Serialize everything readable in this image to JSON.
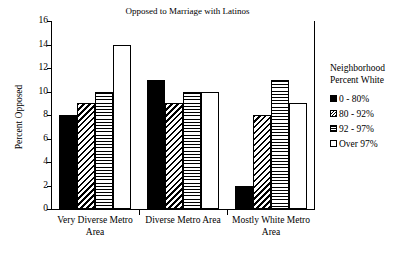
{
  "chart_data": {
    "type": "bar",
    "title": "Opposed to Marriage with Latinos",
    "xlabel": "",
    "ylabel": "Percent Opposed",
    "ylim": [
      0,
      16
    ],
    "yticks": [
      0,
      2,
      4,
      6,
      8,
      10,
      12,
      14,
      16
    ],
    "grid": false,
    "legend_position": "right",
    "legend_title": "Neighborhood Percent White",
    "legend_title_lines": [
      "Neighborhood",
      "Percent White"
    ],
    "categories": [
      "Very Diverse Metro Area",
      "Diverse Metro Area",
      "Mostly White Metro Area"
    ],
    "category_lines": [
      [
        "Very Diverse Metro",
        "Area"
      ],
      [
        "Diverse Metro Area"
      ],
      [
        "Mostly White Metro",
        "Area"
      ]
    ],
    "series": [
      {
        "name": "0 - 80%",
        "pattern": "solid",
        "values": [
          8,
          11,
          2
        ]
      },
      {
        "name": "80 - 92%",
        "pattern": "diagonal",
        "values": [
          9,
          9,
          8
        ]
      },
      {
        "name": "92 - 97%",
        "pattern": "horizontal",
        "values": [
          10,
          10,
          11
        ]
      },
      {
        "name": "Over 97%",
        "pattern": "empty",
        "values": [
          14,
          10,
          9
        ]
      }
    ]
  },
  "colors": {
    "ink": "#000000",
    "paper": "#ffffff"
  }
}
